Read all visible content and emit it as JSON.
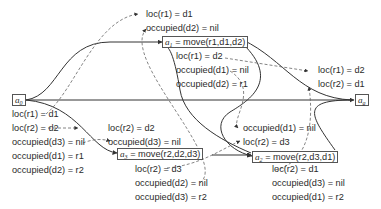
{
  "diagram": {
    "type": "causal-link plan graph",
    "nodes": {
      "a0": {
        "symbol": "a",
        "sub": "0",
        "label": ""
      },
      "a1": {
        "symbol": "a",
        "sub": "1",
        "label": " = move(r1,d1,d2)"
      },
      "a2": {
        "symbol": "a",
        "sub": "2",
        "label": " = move(r2,d3,d1)"
      },
      "a3": {
        "symbol": "a",
        "sub": "3",
        "label": " = move(r2,d2,d3)"
      },
      "ag": {
        "symbol": "a",
        "sub": "g",
        "label": ""
      }
    },
    "a0_effects": [
      "loc(r1) = d1",
      "loc(r2) = d2",
      "occupied(d3) = nil",
      "occupied(d1) = r1",
      "occupied(d2) = r2"
    ],
    "a1_preconditions": [
      "loc(r1) = d1",
      "occupied(d2) = nil"
    ],
    "a1_effects": [
      "loc(r1) = d2",
      "occupied(d1) = nil",
      "occupied(d2) = r1"
    ],
    "a3_preconditions": [
      "loc(r2) = d2",
      "occupied(d3) = nil"
    ],
    "a3_effects": [
      "loc(r2) = d3",
      "occupied(d2) = nil",
      "occupied(d3) = r2"
    ],
    "a2_preconditions": [
      "occupied(d1) = nil",
      "loc(r2) = d3"
    ],
    "a2_effects": [
      "loc(r2) = d1",
      "occupied(d3) = nil",
      "occupied(d1) = r2"
    ],
    "ag_preconditions": [
      "loc(r1) = d2",
      "loc(r2) = d1"
    ],
    "colors": {
      "line": "#333333",
      "dashed": "#666666",
      "box": "#555555"
    }
  }
}
